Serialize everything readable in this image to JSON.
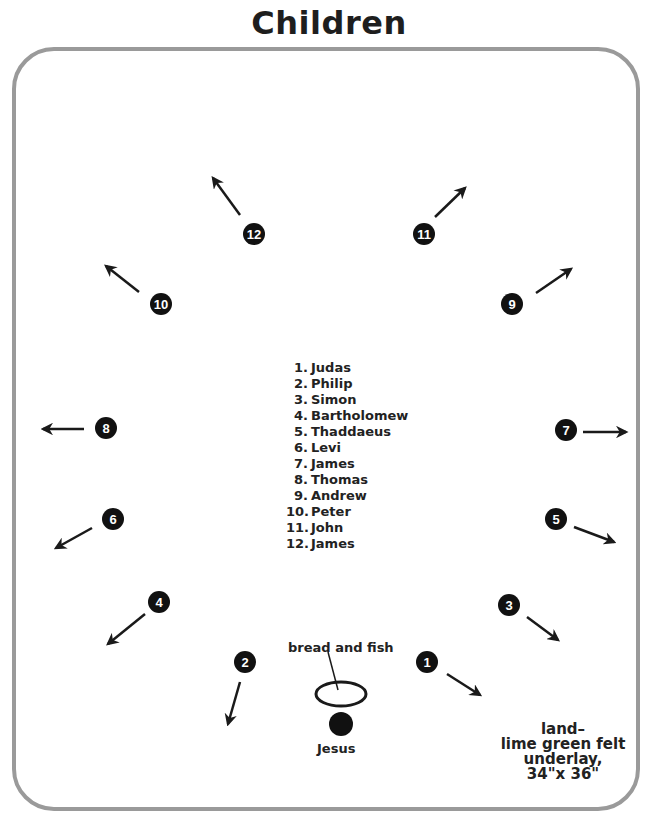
{
  "title": "Children",
  "legend": [
    {
      "num": "1.",
      "name": "Judas"
    },
    {
      "num": "2.",
      "name": "Philip"
    },
    {
      "num": "3.",
      "name": "Simon"
    },
    {
      "num": "4.",
      "name": "Bartholomew"
    },
    {
      "num": "5.",
      "name": "Thaddaeus"
    },
    {
      "num": "6.",
      "name": "Levi"
    },
    {
      "num": "7.",
      "name": "James"
    },
    {
      "num": "8.",
      "name": "Thomas"
    },
    {
      "num": "9.",
      "name": "Andrew"
    },
    {
      "num": "10.",
      "name": "Peter"
    },
    {
      "num": "11.",
      "name": "John"
    },
    {
      "num": "12.",
      "name": "James"
    }
  ],
  "seats": [
    {
      "n": "1",
      "cx": 427,
      "cy": 662,
      "x1": 447,
      "y1": 674,
      "x2": 480,
      "y2": 695
    },
    {
      "n": "2",
      "cx": 245,
      "cy": 662,
      "x1": 240,
      "y1": 682,
      "x2": 228,
      "y2": 724
    },
    {
      "n": "3",
      "cx": 509,
      "cy": 605,
      "x1": 527,
      "y1": 617,
      "x2": 558,
      "y2": 640
    },
    {
      "n": "4",
      "cx": 159,
      "cy": 602,
      "x1": 145,
      "y1": 614,
      "x2": 108,
      "y2": 644
    },
    {
      "n": "5",
      "cx": 556,
      "cy": 519,
      "x1": 574,
      "y1": 527,
      "x2": 614,
      "y2": 542
    },
    {
      "n": "6",
      "cx": 113,
      "cy": 519,
      "x1": 92,
      "y1": 528,
      "x2": 56,
      "y2": 548
    },
    {
      "n": "7",
      "cx": 566,
      "cy": 430,
      "x1": 583,
      "y1": 432,
      "x2": 626,
      "y2": 432
    },
    {
      "n": "8",
      "cx": 106,
      "cy": 428,
      "x1": 84,
      "y1": 429,
      "x2": 43,
      "y2": 429
    },
    {
      "n": "9",
      "cx": 512,
      "cy": 304,
      "x1": 536,
      "y1": 293,
      "x2": 571,
      "y2": 269
    },
    {
      "n": "10",
      "cx": 161,
      "cy": 304,
      "x1": 139,
      "y1": 292,
      "x2": 106,
      "y2": 266
    },
    {
      "n": "11",
      "cx": 424,
      "cy": 234,
      "x1": 435,
      "y1": 217,
      "x2": 465,
      "y2": 188
    },
    {
      "n": "12",
      "cx": 254,
      "cy": 234,
      "x1": 240,
      "y1": 215,
      "x2": 213,
      "y2": 178
    }
  ],
  "food": {
    "label": "bread and fish"
  },
  "jesus": {
    "label": "Jesus"
  },
  "note": {
    "lines": [
      "land–",
      "lime green felt",
      "underlay,",
      "34\"x 36\""
    ]
  },
  "colors": {
    "ink": "#1a1a1a",
    "frame": "#9a9a9a",
    "seat_fill": "#111111",
    "background": "#ffffff"
  }
}
